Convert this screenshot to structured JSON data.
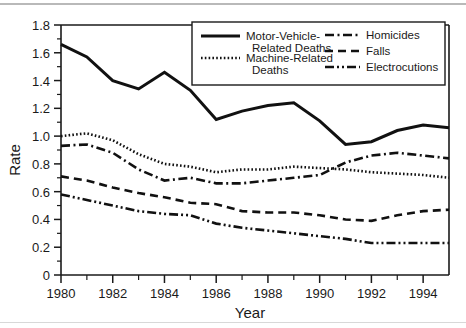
{
  "chart_data": {
    "type": "line",
    "title": "",
    "xlabel": "Year",
    "ylabel": "Rate",
    "xlim": [
      1980,
      1995
    ],
    "ylim": [
      0,
      1.8
    ],
    "ytick_labels": [
      "0",
      "0.2",
      "0.4",
      "0.6",
      "0.8",
      "1.0",
      "1.2",
      "1.4",
      "1.6",
      "1.8"
    ],
    "ytick_values": [
      0,
      0.2,
      0.4,
      0.6,
      0.8,
      1.0,
      1.2,
      1.4,
      1.6,
      1.8
    ],
    "xtick_labels": [
      "1980",
      "1982",
      "1984",
      "1986",
      "1988",
      "1990",
      "1992",
      "1994"
    ],
    "xtick_values": [
      1980,
      1982,
      1984,
      1986,
      1988,
      1990,
      1992,
      1994
    ],
    "x": [
      1980,
      1981,
      1982,
      1983,
      1984,
      1985,
      1986,
      1987,
      1988,
      1989,
      1990,
      1991,
      1992,
      1993,
      1994,
      1995
    ],
    "grid": false,
    "legend_position": "top-right-inside",
    "series": [
      {
        "name": "Motor-Vehicle-Related Deaths",
        "style": "solid",
        "values": [
          1.66,
          1.57,
          1.4,
          1.34,
          1.46,
          1.33,
          1.12,
          1.18,
          1.22,
          1.24,
          1.11,
          0.94,
          0.96,
          1.04,
          1.08,
          1.06
        ]
      },
      {
        "name": "Machine-Related Deaths",
        "style": "dotted",
        "values": [
          1.0,
          1.02,
          0.97,
          0.87,
          0.8,
          0.78,
          0.74,
          0.76,
          0.76,
          0.78,
          0.77,
          0.76,
          0.74,
          0.73,
          0.72,
          0.7
        ]
      },
      {
        "name": "Homicides",
        "style": "dash-dot",
        "values": [
          0.93,
          0.94,
          0.88,
          0.76,
          0.68,
          0.7,
          0.66,
          0.66,
          0.68,
          0.7,
          0.72,
          0.81,
          0.86,
          0.88,
          0.86,
          0.84
        ]
      },
      {
        "name": "Falls",
        "style": "dashed",
        "values": [
          0.71,
          0.68,
          0.63,
          0.59,
          0.56,
          0.52,
          0.51,
          0.46,
          0.45,
          0.45,
          0.43,
          0.4,
          0.39,
          0.43,
          0.46,
          0.47
        ]
      },
      {
        "name": "Electrocutions",
        "style": "dash-dot-dot",
        "values": [
          0.58,
          0.54,
          0.5,
          0.46,
          0.44,
          0.43,
          0.37,
          0.34,
          0.32,
          0.3,
          0.28,
          0.26,
          0.23,
          0.23,
          0.23,
          0.23
        ]
      }
    ]
  },
  "legend": {
    "entries": [
      {
        "label_line1": "Motor-Vehicle-",
        "label_line2": "Related Deaths",
        "style": "solid"
      },
      {
        "label_line1": "Machine-Related",
        "label_line2": "Deaths",
        "style": "dotted"
      },
      {
        "label_line1": "Homicides",
        "label_line2": "",
        "style": "dash-dot"
      },
      {
        "label_line1": "Falls",
        "label_line2": "",
        "style": "dashed"
      },
      {
        "label_line1": "Electrocutions",
        "label_line2": "",
        "style": "dash-dot-dot"
      }
    ]
  },
  "colors": {
    "line": "#111111",
    "axis": "#1a1a1a",
    "background": "#ffffff"
  }
}
